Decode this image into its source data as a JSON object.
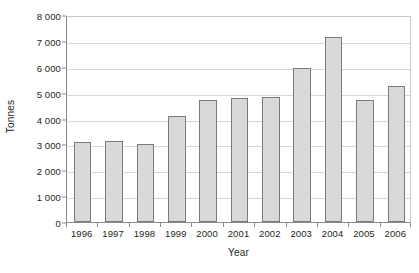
{
  "chart_data": {
    "type": "bar",
    "title": "",
    "subtitle": "",
    "xlabel": "Year",
    "ylabel": "Tonnes",
    "categories": [
      "1996",
      "1997",
      "1998",
      "1999",
      "2000",
      "2001",
      "2002",
      "2003",
      "2004",
      "2005",
      "2006"
    ],
    "values": [
      3080,
      3120,
      3010,
      4100,
      4700,
      4800,
      4850,
      5950,
      7150,
      4700,
      5250
    ],
    "series": [
      {
        "name": "Tonnes",
        "values": [
          3080,
          3120,
          3010,
          4100,
          4700,
          4800,
          4850,
          5950,
          7150,
          4700,
          5250
        ]
      }
    ],
    "ylim": [
      0,
      8000
    ],
    "ytick_values": [
      0,
      1000,
      2000,
      3000,
      4000,
      5000,
      6000,
      7000,
      8000
    ],
    "ytick_labels": [
      "0",
      "1 000",
      "2 000",
      "3 000",
      "4 000",
      "5 000",
      "6 000",
      "7 000",
      "8 000"
    ],
    "grid": "horizontal",
    "legend": "none",
    "bar_color": "#d9d9d9",
    "bar_border_color": "#7b7b7b",
    "gridline_color": "#d8d8d8",
    "axis_color": "#8a8a8a",
    "background_color": "#ffffff",
    "annotations": []
  }
}
